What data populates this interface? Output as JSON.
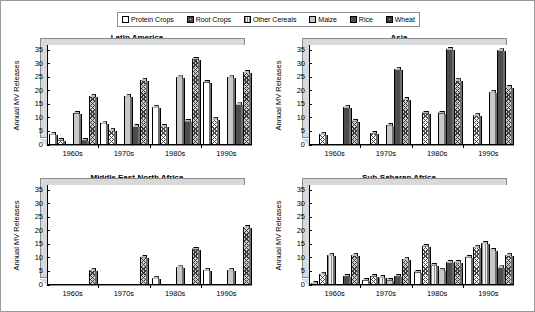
{
  "legend": {
    "position": "top-center",
    "entries": [
      {
        "label": "Protein Crops",
        "key": "protein",
        "pattern": "open-white"
      },
      {
        "label": "Root Crops",
        "key": "root",
        "pattern": "cross-hatch"
      },
      {
        "label": "Other Cereals",
        "key": "other",
        "pattern": "vertical-lines"
      },
      {
        "label": "Maize",
        "key": "maize",
        "pattern": "light-gray"
      },
      {
        "label": "Rice",
        "key": "rice",
        "pattern": "solid-dark"
      },
      {
        "label": "Wheat",
        "key": "wheat",
        "pattern": "dense-cross-hatch"
      }
    ]
  },
  "axis": {
    "ylabel": "Annual MV Releases",
    "yticks": [
      "0",
      "5",
      "10",
      "15",
      "20",
      "25",
      "30",
      "35"
    ],
    "ylim": [
      0,
      37
    ],
    "xticks": [
      "1960s",
      "1970s",
      "1980s",
      "1990s"
    ]
  },
  "chart_data": {
    "type": "bar",
    "title": "",
    "xlabel": "",
    "ylabel": "Annual MV Releases",
    "ylim": [
      0,
      37
    ],
    "grid": false,
    "legend_position": "top-center",
    "categories": [
      "1960s",
      "1970s",
      "1980s",
      "1990s"
    ],
    "panels": [
      {
        "title": "Latin America",
        "series": [
          {
            "name": "Protein Crops",
            "key": "protein",
            "values": [
              4,
              8,
              14,
              23.5
            ]
          },
          {
            "name": "Root Crops",
            "key": "root",
            "values": [
              2,
              5.5,
              7,
              9.5
            ]
          },
          {
            "name": "Other Cereals",
            "key": "other",
            "values": [
              0,
              0,
              0,
              0
            ]
          },
          {
            "name": "Maize",
            "key": "maize",
            "values": [
              12,
              18,
              25,
              25
            ]
          },
          {
            "name": "Rice",
            "key": "rice",
            "values": [
              2,
              7,
              9,
              15
            ]
          },
          {
            "name": "Wheat",
            "key": "wheat",
            "values": [
              18,
              24,
              32,
              27
            ]
          }
        ]
      },
      {
        "title": "Asia",
        "series": [
          {
            "name": "Protein Crops",
            "key": "protein",
            "values": [
              0,
              0,
              0,
              0
            ]
          },
          {
            "name": "Root Crops",
            "key": "root",
            "values": [
              4,
              4.5,
              12,
              11
            ]
          },
          {
            "name": "Other Cereals",
            "key": "other",
            "values": [
              0,
              0,
              0,
              0
            ]
          },
          {
            "name": "Maize",
            "key": "maize",
            "values": [
              0,
              7.5,
              12,
              19.5
            ]
          },
          {
            "name": "Rice",
            "key": "rice",
            "values": [
              14,
              28,
              35.5,
              35
            ]
          },
          {
            "name": "Wheat",
            "key": "wheat",
            "values": [
              9,
              17,
              24,
              21.5
            ]
          }
        ]
      },
      {
        "title": "Middle East-North Africa",
        "series": [
          {
            "name": "Protein Crops",
            "key": "protein",
            "values": [
              0,
              0,
              2.5,
              5.5
            ]
          },
          {
            "name": "Root Crops",
            "key": "root",
            "values": [
              0,
              0,
              0,
              0
            ]
          },
          {
            "name": "Other Cereals",
            "key": "other",
            "values": [
              0,
              0,
              0,
              0
            ]
          },
          {
            "name": "Maize",
            "key": "maize",
            "values": [
              0,
              0,
              6.5,
              5.5
            ]
          },
          {
            "name": "Rice",
            "key": "rice",
            "values": [
              0,
              0,
              0,
              0
            ]
          },
          {
            "name": "Wheat",
            "key": "wheat",
            "values": [
              5.5,
              10.5,
              13.5,
              21.5
            ]
          }
        ]
      },
      {
        "title": "Sub-Saharan Africa",
        "series": [
          {
            "name": "Protein Crops",
            "key": "protein",
            "values": [
              0.5,
              2,
              5,
              10.5
            ]
          },
          {
            "name": "Root Crops",
            "key": "root",
            "values": [
              4,
              3.5,
              14.5,
              14
            ]
          },
          {
            "name": "Other Cereals",
            "key": "other",
            "values": [
              11,
              3,
              7.5,
              15.5
            ]
          },
          {
            "name": "Maize",
            "key": "maize",
            "values": [
              0,
              2,
              5.5,
              13
            ]
          },
          {
            "name": "Rice",
            "key": "rice",
            "values": [
              3.5,
              3.5,
              8.5,
              6.5
            ]
          },
          {
            "name": "Wheat",
            "key": "wheat",
            "values": [
              11,
              9.5,
              8.5,
              11
            ]
          }
        ]
      }
    ]
  }
}
